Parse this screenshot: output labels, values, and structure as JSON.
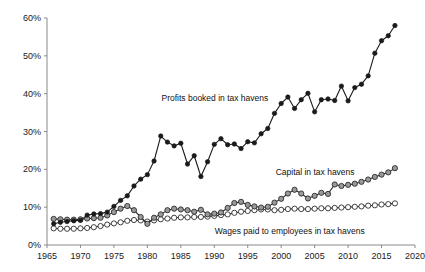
{
  "chart_data": {
    "type": "line",
    "title": "",
    "subtitle": "",
    "xlabel": "",
    "ylabel": "",
    "xlim": [
      1965,
      2020
    ],
    "ylim": [
      0,
      60
    ],
    "grid": false,
    "legend_position": "inline-annotations",
    "y_tick_labels": [
      "0%",
      "10%",
      "20%",
      "30%",
      "40%",
      "50%",
      "60%"
    ],
    "y_tick_values": [
      0,
      10,
      20,
      30,
      40,
      50,
      60
    ],
    "x_tick_labels": [
      "1965",
      "1970",
      "1975",
      "1980",
      "1985",
      "1990",
      "1995",
      "2000",
      "2005",
      "2010",
      "2015",
      "2020"
    ],
    "x_tick_values": [
      1965,
      1970,
      1975,
      1980,
      1985,
      1990,
      1995,
      2000,
      2005,
      2010,
      2015,
      2020
    ],
    "x": [
      1966,
      1967,
      1968,
      1969,
      1970,
      1971,
      1972,
      1973,
      1974,
      1975,
      1976,
      1977,
      1978,
      1979,
      1980,
      1981,
      1982,
      1983,
      1984,
      1985,
      1986,
      1987,
      1988,
      1989,
      1990,
      1991,
      1992,
      1993,
      1994,
      1995,
      1996,
      1997,
      1998,
      1999,
      2000,
      2001,
      2002,
      2003,
      2004,
      2005,
      2006,
      2007,
      2008,
      2009,
      2010,
      2011,
      2012,
      2013,
      2014,
      2015,
      2016,
      2017
    ],
    "series": [
      {
        "name": "Profits booked in tax havens",
        "marker": "filled-circle",
        "color": "#1a1a1a",
        "fill": "#1a1a1a",
        "values": [
          5.6,
          6.0,
          6.2,
          6.4,
          6.5,
          7.9,
          8.2,
          8.3,
          8.7,
          10.2,
          11.8,
          13.0,
          15.6,
          17.4,
          18.6,
          22.2,
          28.8,
          27.2,
          26.2,
          26.9,
          21.4,
          23.6,
          18.1,
          22.0,
          26.6,
          28.1,
          26.5,
          26.7,
          25.5,
          27.3,
          27.0,
          29.4,
          30.8,
          34.8,
          37.4,
          39.1,
          36.1,
          38.4,
          40.1,
          35.2,
          38.4,
          38.6,
          38.2,
          42.0,
          38.1,
          41.6,
          42.5,
          44.7,
          50.7,
          54.0,
          55.3,
          58.0
        ]
      },
      {
        "name": "Capital in tax havens",
        "marker": "gray-circle",
        "color": "#2b2b2b",
        "fill": "#9a9a9a",
        "values": [
          6.9,
          6.8,
          6.7,
          6.7,
          6.8,
          7.0,
          7.1,
          7.2,
          7.8,
          8.7,
          9.6,
          10.3,
          9.2,
          7.4,
          5.6,
          7.2,
          8.1,
          9.2,
          9.6,
          9.4,
          9.2,
          8.8,
          9.3,
          8.1,
          8.3,
          8.6,
          9.8,
          11.1,
          11.4,
          10.6,
          10.2,
          9.9,
          10.1,
          11.2,
          12.2,
          13.6,
          14.6,
          13.6,
          12.3,
          13.0,
          13.8,
          13.5,
          16.0,
          15.6,
          15.9,
          16.2,
          16.7,
          17.3,
          18.0,
          18.6,
          19.2,
          20.3
        ]
      },
      {
        "name": "Wages paid to employees in tax havens",
        "marker": "open-circle",
        "color": "#2b2b2b",
        "fill": "#ffffff",
        "values": [
          4.4,
          4.3,
          4.3,
          4.3,
          4.4,
          4.5,
          4.7,
          5.0,
          5.4,
          5.7,
          6.0,
          6.4,
          6.6,
          6.5,
          6.2,
          6.5,
          6.8,
          7.0,
          7.2,
          7.3,
          7.3,
          7.4,
          7.4,
          7.5,
          7.7,
          7.9,
          8.1,
          8.5,
          8.8,
          9.0,
          9.2,
          9.4,
          9.4,
          9.2,
          9.3,
          9.5,
          9.6,
          9.5,
          9.5,
          9.6,
          9.7,
          9.7,
          9.8,
          9.9,
          10.0,
          10.1,
          10.2,
          10.4,
          10.5,
          10.7,
          10.8,
          11.0
        ]
      }
    ],
    "annotations": [
      {
        "label": "Profits booked in tax havens",
        "x_pct": 50.8,
        "y_pct": 36.0,
        "name": "annotation-profits"
      },
      {
        "label": "Capital in tax havens",
        "x_pct": 74.5,
        "y_pct": 63.4,
        "name": "annotation-capital"
      },
      {
        "label": "Wages paid to employees in tax havens",
        "x_pct": 68.5,
        "y_pct": 85.0,
        "name": "annotation-wages"
      }
    ]
  }
}
